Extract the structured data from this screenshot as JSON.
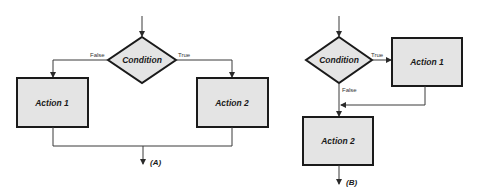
{
  "diagrams": {
    "a": {
      "caption": "(A)",
      "condition": "Condition",
      "false_label": "False",
      "true_label": "True",
      "action_false": "Action 1",
      "action_true": "Action 2"
    },
    "b": {
      "caption": "(B)",
      "condition": "Condition",
      "true_label": "True",
      "false_label": "False",
      "action_true": "Action 1",
      "action_after": "Action 2"
    }
  },
  "colors": {
    "box_fill": "#e4e4e4",
    "stroke": "#1a1a1a",
    "background": "#ffffff"
  }
}
